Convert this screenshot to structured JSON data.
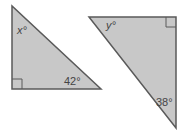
{
  "figure": {
    "triangles": [
      {
        "id": "left",
        "vertices": [
          [
            12,
            6
          ],
          [
            12,
            89
          ],
          [
            101,
            89
          ]
        ],
        "right_angle_vertex": [
          12,
          89
        ],
        "angles": [
          {
            "label": "x°",
            "variable": true
          },
          {
            "label": "42°",
            "variable": false
          },
          {
            "label": "90°",
            "marked_as_right_angle": true
          }
        ]
      },
      {
        "id": "right",
        "vertices": [
          [
            89,
            17
          ],
          [
            176,
            17
          ],
          [
            176,
            128
          ]
        ],
        "right_angle_vertex": [
          176,
          17
        ],
        "angles": [
          {
            "label": "y°",
            "variable": true
          },
          {
            "label": "38°",
            "variable": false
          },
          {
            "label": "90°",
            "marked_as_right_angle": true
          }
        ]
      }
    ],
    "labels": {
      "x": "x°",
      "angle_left": "42°",
      "y": "y°",
      "angle_right": "38°"
    },
    "colors": {
      "fill": "#c8c8c8",
      "stroke": "#5a5a5a"
    }
  }
}
